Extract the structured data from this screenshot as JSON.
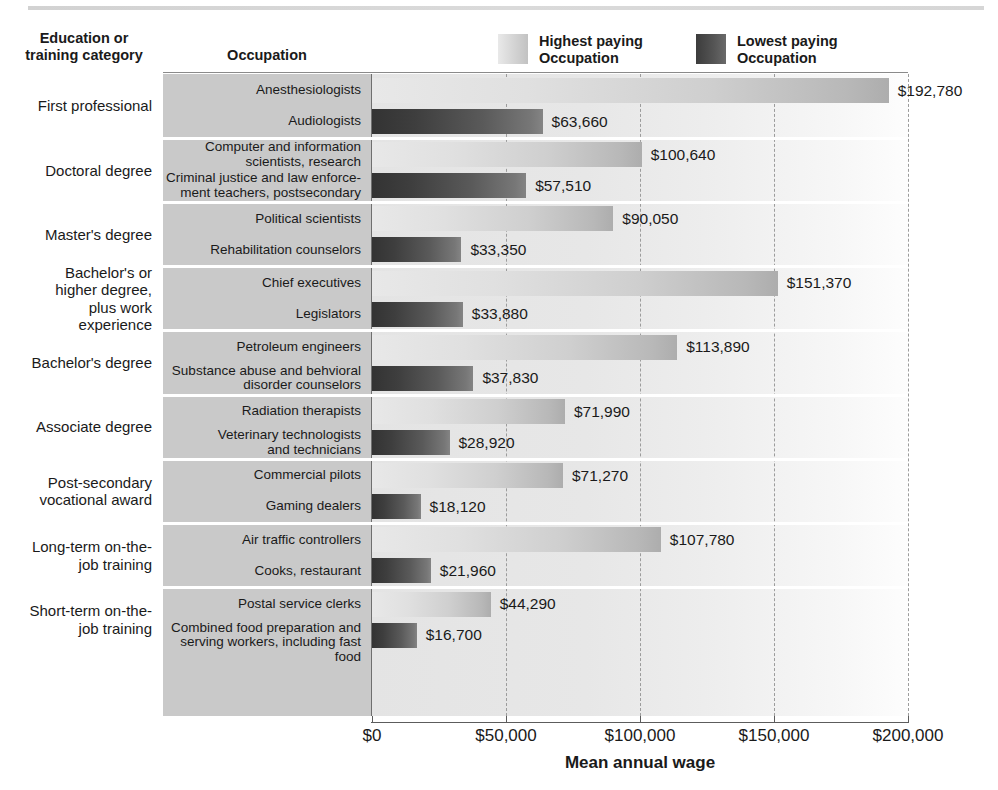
{
  "header": {
    "category_label_line1": "Education or",
    "category_label_line2": "training category",
    "occupation_label": "Occupation"
  },
  "legend": {
    "items": [
      {
        "name": "highest-paying",
        "line1": "Highest paying",
        "line2": "Occupation",
        "swatch": "#d3d3d3"
      },
      {
        "name": "lowest-paying",
        "line1": "Lowest paying",
        "line2": "Occupation",
        "swatch": "#555555"
      }
    ]
  },
  "chart_data": {
    "type": "bar",
    "title": "",
    "xlabel": "Mean annual wage",
    "ylabel": "",
    "xlim": [
      0,
      200000
    ],
    "xticks": [
      0,
      50000,
      100000,
      150000,
      200000
    ],
    "xtick_labels": [
      "$0",
      "$50,000",
      "$100,000",
      "$150,000",
      "$200,000"
    ],
    "grid": true,
    "grid_axis": "x",
    "legend_position": "top",
    "orientation": "horizontal",
    "series": [
      {
        "name": "Highest paying Occupation",
        "color": "#d3d3d3"
      },
      {
        "name": "Lowest paying Occupation",
        "color": "#555555"
      }
    ],
    "groups": [
      {
        "category": "First professional",
        "category_lines": [
          "First professional"
        ],
        "bars": [
          {
            "series": "Highest paying Occupation",
            "occupation_lines": [
              "Anesthesiologists"
            ],
            "value": 192780,
            "value_label": "$192,780"
          },
          {
            "series": "Lowest paying Occupation",
            "occupation_lines": [
              "Audiologists"
            ],
            "value": 63660,
            "value_label": "$63,660"
          }
        ]
      },
      {
        "category": "Doctoral degree",
        "category_lines": [
          "Doctoral degree"
        ],
        "bars": [
          {
            "series": "Highest paying Occupation",
            "occupation_lines": [
              "Computer and information",
              "scientists, research"
            ],
            "value": 100640,
            "value_label": "$100,640"
          },
          {
            "series": "Lowest paying Occupation",
            "occupation_lines": [
              "Criminal justice and law enforce-",
              "ment teachers, postsecondary"
            ],
            "value": 57510,
            "value_label": "$57,510"
          }
        ]
      },
      {
        "category": "Master's degree",
        "category_lines": [
          "Master's degree"
        ],
        "bars": [
          {
            "series": "Highest paying Occupation",
            "occupation_lines": [
              "Political scientists"
            ],
            "value": 90050,
            "value_label": "$90,050"
          },
          {
            "series": "Lowest paying Occupation",
            "occupation_lines": [
              "Rehabilitation counselors"
            ],
            "value": 33350,
            "value_label": "$33,350"
          }
        ]
      },
      {
        "category": "Bachelor's or higher degree, plus work experience",
        "category_lines": [
          "Bachelor's or",
          "higher degree,",
          "plus work",
          "experience"
        ],
        "bars": [
          {
            "series": "Highest paying Occupation",
            "occupation_lines": [
              "Chief executives"
            ],
            "value": 151370,
            "value_label": "$151,370"
          },
          {
            "series": "Lowest paying Occupation",
            "occupation_lines": [
              "Legislators"
            ],
            "value": 33880,
            "value_label": "$33,880"
          }
        ]
      },
      {
        "category": "Bachelor's degree",
        "category_lines": [
          "Bachelor's degree"
        ],
        "bars": [
          {
            "series": "Highest paying Occupation",
            "occupation_lines": [
              "Petroleum engineers"
            ],
            "value": 113890,
            "value_label": "$113,890"
          },
          {
            "series": "Lowest paying Occupation",
            "occupation_lines": [
              "Substance abuse and behvioral",
              "disorder counselors"
            ],
            "value": 37830,
            "value_label": "$37,830"
          }
        ]
      },
      {
        "category": "Associate degree",
        "category_lines": [
          "Associate degree"
        ],
        "bars": [
          {
            "series": "Highest paying Occupation",
            "occupation_lines": [
              "Radiation therapists"
            ],
            "value": 71990,
            "value_label": "$71,990"
          },
          {
            "series": "Lowest paying Occupation",
            "occupation_lines": [
              "Veterinary technologists",
              "and technicians"
            ],
            "value": 28920,
            "value_label": "$28,920"
          }
        ]
      },
      {
        "category": "Post-secondary vocational award",
        "category_lines": [
          "Post-secondary",
          "vocational award"
        ],
        "bars": [
          {
            "series": "Highest paying Occupation",
            "occupation_lines": [
              "Commercial pilots"
            ],
            "value": 71270,
            "value_label": "$71,270"
          },
          {
            "series": "Lowest paying Occupation",
            "occupation_lines": [
              "Gaming dealers"
            ],
            "value": 18120,
            "value_label": "$18,120"
          }
        ]
      },
      {
        "category": "Long-term on-the-job training",
        "category_lines": [
          "Long-term on-the-",
          "job training"
        ],
        "bars": [
          {
            "series": "Highest paying Occupation",
            "occupation_lines": [
              "Air traffic controllers"
            ],
            "value": 107780,
            "value_label": "$107,780"
          },
          {
            "series": "Lowest paying Occupation",
            "occupation_lines": [
              "Cooks, restaurant"
            ],
            "value": 21960,
            "value_label": "$21,960"
          }
        ]
      },
      {
        "category": "Short-term on-the-job training",
        "category_lines": [
          "Short-term on-the-",
          "job training"
        ],
        "bars": [
          {
            "series": "Highest paying Occupation",
            "occupation_lines": [
              "Postal service clerks"
            ],
            "value": 44290,
            "value_label": "$44,290"
          },
          {
            "series": "Lowest paying Occupation",
            "occupation_lines": [
              "Combined food preparation and",
              "serving workers, including fast food"
            ],
            "value": 16700,
            "value_label": "$16,700"
          }
        ]
      }
    ]
  }
}
